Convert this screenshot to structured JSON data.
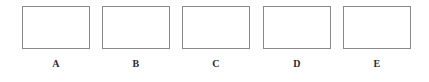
{
  "figure": {
    "background_color": "#ffffff",
    "width": 429,
    "height": 82,
    "border_color": "#8a8a8a",
    "label_color": "#2b2b2b",
    "panels": [
      {
        "label": "A",
        "left": 22,
        "top": 6,
        "width": 68,
        "height": 43,
        "content": ""
      },
      {
        "label": "B",
        "left": 102,
        "top": 6,
        "width": 68,
        "height": 43,
        "content": ""
      },
      {
        "label": "C",
        "left": 182,
        "top": 6,
        "width": 68,
        "height": 43,
        "content": ""
      },
      {
        "label": "D",
        "left": 263,
        "top": 6,
        "width": 68,
        "height": 43,
        "content": ""
      },
      {
        "label": "E",
        "left": 343,
        "top": 6,
        "width": 68,
        "height": 43,
        "content": ""
      }
    ]
  }
}
